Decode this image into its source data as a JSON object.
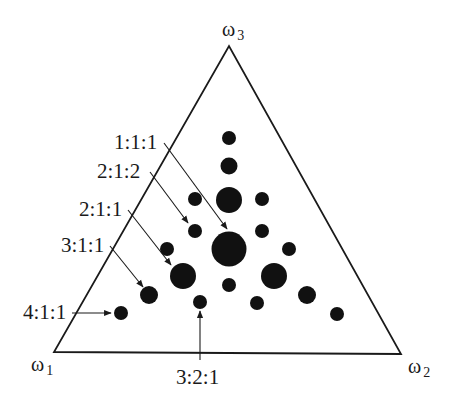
{
  "vertices": {
    "w1": {
      "symbol": "ω",
      "sub": "1"
    },
    "w2": {
      "symbol": "ω",
      "sub": "2"
    },
    "w3": {
      "symbol": "ω",
      "sub": "3"
    }
  },
  "labels": {
    "l111": "1:1:1",
    "l212": "2:1:2",
    "l211": "2:1:1",
    "l311": "3:1:1",
    "l411": "4:1:1",
    "l321": "3:2:1"
  },
  "colors": {
    "ink": "#111111",
    "line": "#1a1a1a",
    "background": "#ffffff"
  },
  "triangle": {
    "w1": [
      54,
      352
    ],
    "w2": [
      401,
      354
    ],
    "w3": [
      229,
      46
    ]
  },
  "dots": [
    {
      "cx": 229,
      "cy": 138,
      "r": 7
    },
    {
      "cx": 229,
      "cy": 166,
      "r": 8.5
    },
    {
      "cx": 229,
      "cy": 200,
      "r": 13
    },
    {
      "cx": 195,
      "cy": 199,
      "r": 7
    },
    {
      "cx": 262,
      "cy": 199,
      "r": 7
    },
    {
      "cx": 195,
      "cy": 231,
      "r": 7
    },
    {
      "cx": 262,
      "cy": 231,
      "r": 7
    },
    {
      "cx": 229,
      "cy": 249,
      "r": 17.5
    },
    {
      "cx": 167,
      "cy": 249,
      "r": 7
    },
    {
      "cx": 289,
      "cy": 249,
      "r": 7
    },
    {
      "cx": 183,
      "cy": 276,
      "r": 13
    },
    {
      "cx": 274,
      "cy": 276,
      "r": 13
    },
    {
      "cx": 229,
      "cy": 285,
      "r": 7
    },
    {
      "cx": 149,
      "cy": 295,
      "r": 9
    },
    {
      "cx": 307,
      "cy": 295,
      "r": 9
    },
    {
      "cx": 200,
      "cy": 302,
      "r": 7
    },
    {
      "cx": 257,
      "cy": 303,
      "r": 7
    },
    {
      "cx": 121,
      "cy": 313,
      "r": 7
    },
    {
      "cx": 337,
      "cy": 314,
      "r": 7
    }
  ],
  "arrows": [
    {
      "name": "arrow-1-1-1",
      "x1": 164,
      "y1": 143,
      "x2": 227,
      "y2": 229
    },
    {
      "name": "arrow-2-1-2",
      "x1": 150,
      "y1": 172,
      "x2": 188,
      "y2": 223
    },
    {
      "name": "arrow-2-1-1",
      "x1": 128,
      "y1": 210,
      "x2": 171,
      "y2": 265
    },
    {
      "name": "arrow-3-1-1",
      "x1": 110,
      "y1": 246,
      "x2": 143,
      "y2": 287
    },
    {
      "name": "arrow-4-1-1",
      "x1": 72,
      "y1": 313,
      "x2": 111,
      "y2": 313
    },
    {
      "name": "arrow-3-2-1",
      "x1": 200,
      "y1": 360,
      "x2": 200,
      "y2": 311
    }
  ]
}
